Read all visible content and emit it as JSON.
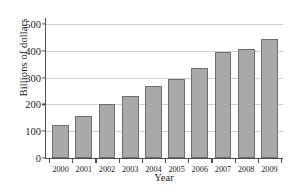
{
  "chart_data": {
    "type": "bar",
    "title": "",
    "xlabel": "Year",
    "ylabel": "Billions of dollars",
    "categories": [
      "2000",
      "2001",
      "2002",
      "2003",
      "2004",
      "2005",
      "2006",
      "2007",
      "2008",
      "2009"
    ],
    "values": [
      122,
      155,
      203,
      230,
      267,
      293,
      337,
      396,
      407,
      444
    ],
    "ylim": [
      0,
      500
    ],
    "yticks": [
      0,
      100,
      200,
      300,
      400,
      500
    ],
    "ytick_labels": [
      "0",
      "100",
      "200",
      "300",
      "400",
      "500"
    ],
    "grid": true,
    "legend": false,
    "bar_color": "#a9a9a9",
    "bar_edge_color": "#6e6e6e",
    "gridline_color": "#cfcfcf",
    "axis_color": "#4d4d4d",
    "background": "#ffffff"
  }
}
